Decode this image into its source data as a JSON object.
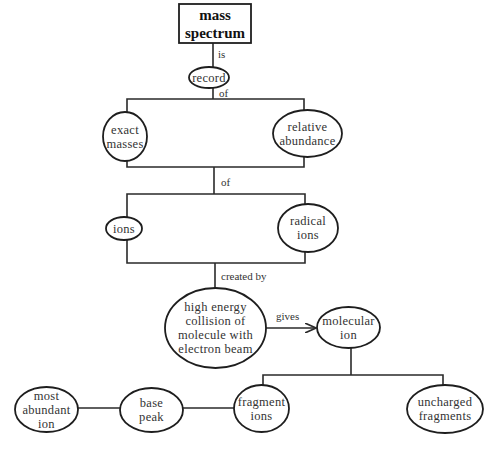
{
  "title": "mass spectrum",
  "nodes": {
    "mass_spectrum": "mass\nspectrum",
    "record": "record",
    "exact_masses": "exact\nmasses",
    "relative_abundance": "relative\nabundance",
    "ions": "ions",
    "radical_ions": "radical\nions",
    "collision": "high energy\ncollision of\nmolecule with\nelectron beam",
    "molecular_ion": "molecular\nion",
    "fragment_ions": "fragment\nions",
    "uncharged_fragments": "uncharged\nfragments",
    "base_peak": "base\npeak",
    "most_abundant_ion": "most\nabundant\nion"
  },
  "links": {
    "is": "is",
    "of_1": "of",
    "of_2": "of",
    "created_by": "created by",
    "gives": "gives"
  },
  "colors": {
    "line": "#2a2a2a",
    "text": "#333333",
    "background": "#ffffff"
  }
}
